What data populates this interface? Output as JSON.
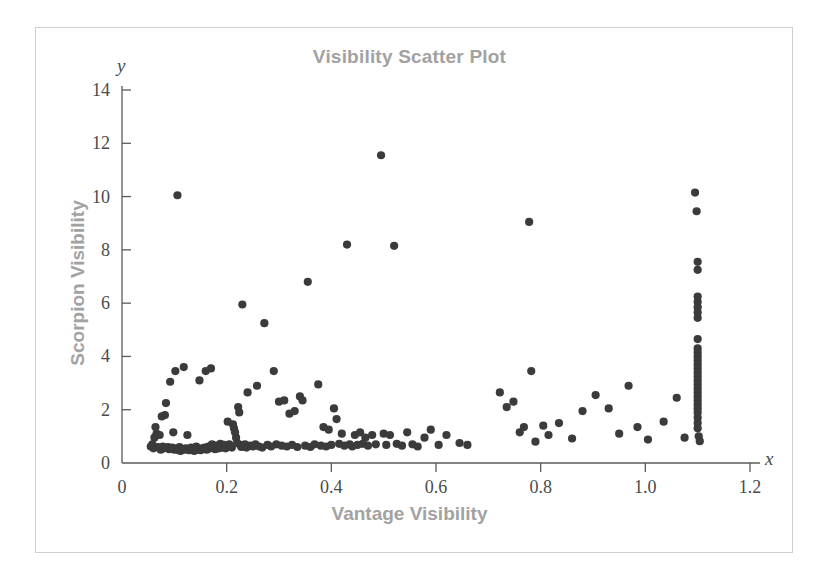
{
  "figure": {
    "title": "Visibility Scatter Plot",
    "x_axis_variable": "x",
    "y_axis_variable": "y",
    "x_axis_label": "Vantage Visibility",
    "y_axis_label": "Scorpion Visibility",
    "point_color": "#3b3b3b",
    "label_color": "#a2a2a2",
    "axis_color": "#5a5a5a",
    "frame_color": "#cfcfcf",
    "background_color": "#ffffff"
  },
  "chart_data": {
    "type": "scatter",
    "title": "Visibility Scatter Plot",
    "xlabel": "Vantage Visibility",
    "ylabel": "Scorpion Visibility",
    "xlim": [
      0,
      1.2
    ],
    "ylim": [
      0,
      14
    ],
    "xticks": [
      0,
      0.2,
      0.4,
      0.6,
      0.8,
      1.0,
      1.2
    ],
    "xtick_labels": [
      "0",
      "0.2",
      "0.4",
      "0.6",
      "0.8",
      "1.0",
      "1.2"
    ],
    "yticks": [
      0,
      2,
      4,
      6,
      8,
      10,
      12,
      14
    ],
    "ytick_labels": [
      "0",
      "2",
      "4",
      "6",
      "8",
      "10",
      "12",
      "14"
    ],
    "grid": false,
    "legend": false,
    "marker": "circle",
    "marker_size": 7,
    "marker_color": "#3b3b3b",
    "points": [
      [
        0.055,
        0.62
      ],
      [
        0.058,
        0.7
      ],
      [
        0.06,
        0.55
      ],
      [
        0.062,
        0.95
      ],
      [
        0.064,
        1.35
      ],
      [
        0.066,
        1.1
      ],
      [
        0.068,
        0.6
      ],
      [
        0.07,
        0.58
      ],
      [
        0.072,
        1.05
      ],
      [
        0.074,
        0.5
      ],
      [
        0.076,
        1.75
      ],
      [
        0.078,
        0.62
      ],
      [
        0.08,
        0.55
      ],
      [
        0.082,
        1.8
      ],
      [
        0.084,
        2.25
      ],
      [
        0.086,
        0.58
      ],
      [
        0.088,
        0.6
      ],
      [
        0.09,
        0.52
      ],
      [
        0.092,
        3.05
      ],
      [
        0.094,
        0.55
      ],
      [
        0.096,
        0.58
      ],
      [
        0.098,
        1.15
      ],
      [
        0.1,
        0.5
      ],
      [
        0.102,
        3.45
      ],
      [
        0.104,
        0.55
      ],
      [
        0.106,
        10.05
      ],
      [
        0.108,
        0.48
      ],
      [
        0.11,
        0.6
      ],
      [
        0.112,
        0.45
      ],
      [
        0.115,
        0.52
      ],
      [
        0.118,
        3.6
      ],
      [
        0.12,
        0.5
      ],
      [
        0.122,
        0.55
      ],
      [
        0.125,
        1.05
      ],
      [
        0.128,
        0.48
      ],
      [
        0.13,
        0.52
      ],
      [
        0.132,
        0.58
      ],
      [
        0.135,
        0.5
      ],
      [
        0.138,
        0.45
      ],
      [
        0.14,
        0.55
      ],
      [
        0.142,
        0.62
      ],
      [
        0.145,
        0.5
      ],
      [
        0.148,
        3.1
      ],
      [
        0.15,
        0.48
      ],
      [
        0.152,
        0.55
      ],
      [
        0.155,
        0.52
      ],
      [
        0.158,
        0.58
      ],
      [
        0.16,
        3.45
      ],
      [
        0.162,
        0.5
      ],
      [
        0.165,
        0.62
      ],
      [
        0.168,
        0.55
      ],
      [
        0.17,
        3.55
      ],
      [
        0.172,
        0.7
      ],
      [
        0.175,
        0.58
      ],
      [
        0.178,
        0.52
      ],
      [
        0.18,
        0.65
      ],
      [
        0.182,
        0.6
      ],
      [
        0.185,
        0.55
      ],
      [
        0.188,
        0.72
      ],
      [
        0.19,
        0.62
      ],
      [
        0.192,
        0.58
      ],
      [
        0.195,
        0.68
      ],
      [
        0.198,
        0.55
      ],
      [
        0.2,
        0.6
      ],
      [
        0.202,
        1.55
      ],
      [
        0.205,
        0.7
      ],
      [
        0.208,
        0.62
      ],
      [
        0.21,
        0.58
      ],
      [
        0.212,
        1.45
      ],
      [
        0.214,
        1.3
      ],
      [
        0.216,
        1.15
      ],
      [
        0.218,
        0.95
      ],
      [
        0.22,
        0.75
      ],
      [
        0.222,
        2.1
      ],
      [
        0.224,
        1.9
      ],
      [
        0.226,
        0.68
      ],
      [
        0.228,
        0.6
      ],
      [
        0.23,
        5.95
      ],
      [
        0.232,
        0.62
      ],
      [
        0.235,
        0.7
      ],
      [
        0.238,
        0.58
      ],
      [
        0.24,
        2.65
      ],
      [
        0.245,
        0.65
      ],
      [
        0.25,
        0.62
      ],
      [
        0.255,
        0.7
      ],
      [
        0.258,
        2.9
      ],
      [
        0.262,
        0.62
      ],
      [
        0.268,
        0.58
      ],
      [
        0.272,
        5.25
      ],
      [
        0.278,
        0.68
      ],
      [
        0.285,
        0.62
      ],
      [
        0.29,
        3.45
      ],
      [
        0.295,
        0.7
      ],
      [
        0.3,
        2.3
      ],
      [
        0.305,
        0.65
      ],
      [
        0.31,
        2.35
      ],
      [
        0.315,
        0.62
      ],
      [
        0.32,
        1.85
      ],
      [
        0.325,
        0.68
      ],
      [
        0.33,
        1.95
      ],
      [
        0.335,
        0.6
      ],
      [
        0.34,
        2.5
      ],
      [
        0.345,
        2.35
      ],
      [
        0.35,
        0.65
      ],
      [
        0.355,
        6.8
      ],
      [
        0.36,
        0.6
      ],
      [
        0.368,
        0.7
      ],
      [
        0.375,
        2.95
      ],
      [
        0.38,
        0.65
      ],
      [
        0.385,
        1.35
      ],
      [
        0.39,
        0.62
      ],
      [
        0.395,
        1.25
      ],
      [
        0.4,
        0.68
      ],
      [
        0.405,
        2.05
      ],
      [
        0.41,
        1.65
      ],
      [
        0.415,
        0.72
      ],
      [
        0.42,
        1.1
      ],
      [
        0.425,
        0.65
      ],
      [
        0.43,
        8.2
      ],
      [
        0.435,
        0.7
      ],
      [
        0.44,
        0.62
      ],
      [
        0.445,
        1.05
      ],
      [
        0.45,
        0.68
      ],
      [
        0.455,
        1.15
      ],
      [
        0.46,
        0.72
      ],
      [
        0.465,
        0.95
      ],
      [
        0.47,
        0.65
      ],
      [
        0.478,
        1.05
      ],
      [
        0.485,
        0.7
      ],
      [
        0.495,
        11.55
      ],
      [
        0.5,
        1.1
      ],
      [
        0.505,
        0.68
      ],
      [
        0.512,
        1.05
      ],
      [
        0.52,
        8.15
      ],
      [
        0.525,
        0.72
      ],
      [
        0.535,
        0.65
      ],
      [
        0.545,
        1.15
      ],
      [
        0.555,
        0.7
      ],
      [
        0.565,
        0.62
      ],
      [
        0.578,
        0.95
      ],
      [
        0.59,
        1.25
      ],
      [
        0.605,
        0.68
      ],
      [
        0.62,
        1.05
      ],
      [
        0.645,
        0.75
      ],
      [
        0.66,
        0.68
      ],
      [
        0.722,
        2.65
      ],
      [
        0.735,
        2.1
      ],
      [
        0.748,
        2.3
      ],
      [
        0.76,
        1.15
      ],
      [
        0.768,
        1.35
      ],
      [
        0.778,
        9.05
      ],
      [
        0.782,
        3.45
      ],
      [
        0.79,
        0.8
      ],
      [
        0.805,
        1.4
      ],
      [
        0.815,
        1.05
      ],
      [
        0.835,
        1.5
      ],
      [
        0.86,
        0.92
      ],
      [
        0.88,
        1.95
      ],
      [
        0.905,
        2.55
      ],
      [
        0.93,
        2.05
      ],
      [
        0.95,
        1.1
      ],
      [
        0.968,
        2.9
      ],
      [
        0.985,
        1.35
      ],
      [
        1.005,
        0.88
      ],
      [
        1.035,
        1.55
      ],
      [
        1.06,
        2.45
      ],
      [
        1.075,
        0.95
      ],
      [
        1.095,
        10.15
      ],
      [
        1.098,
        9.45
      ],
      [
        1.1,
        7.55
      ],
      [
        1.1,
        7.25
      ],
      [
        1.1,
        6.25
      ],
      [
        1.1,
        6.05
      ],
      [
        1.1,
        5.85
      ],
      [
        1.1,
        5.65
      ],
      [
        1.1,
        5.45
      ],
      [
        1.1,
        4.65
      ],
      [
        1.1,
        4.3
      ],
      [
        1.1,
        4.15
      ],
      [
        1.1,
        4.0
      ],
      [
        1.1,
        3.85
      ],
      [
        1.1,
        3.7
      ],
      [
        1.1,
        3.55
      ],
      [
        1.1,
        3.4
      ],
      [
        1.1,
        3.25
      ],
      [
        1.1,
        3.1
      ],
      [
        1.1,
        2.95
      ],
      [
        1.1,
        2.8
      ],
      [
        1.1,
        2.65
      ],
      [
        1.1,
        2.5
      ],
      [
        1.1,
        2.35
      ],
      [
        1.1,
        2.2
      ],
      [
        1.1,
        2.05
      ],
      [
        1.1,
        1.9
      ],
      [
        1.1,
        1.7
      ],
      [
        1.1,
        1.5
      ],
      [
        1.1,
        1.3
      ],
      [
        1.102,
        1.0
      ],
      [
        1.104,
        0.82
      ]
    ]
  }
}
